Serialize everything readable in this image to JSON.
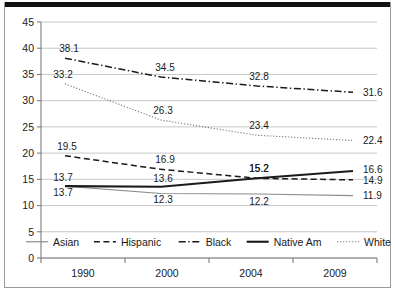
{
  "chart_data": {
    "type": "line",
    "title": "",
    "subtitle": "",
    "xlabel": "",
    "ylabel": "",
    "categories": [
      "1990",
      "2000",
      "2004",
      "2009"
    ],
    "ylim": [
      0,
      45
    ],
    "ytick_step": 5,
    "yticks": [
      "0",
      "5",
      "10",
      "15",
      "20",
      "25",
      "30",
      "35",
      "40",
      "45"
    ],
    "grid": true,
    "legend_position": "inside-bottom",
    "series": [
      {
        "name": "Asian",
        "style": "thin-solid-gray",
        "color": "#8c8c8c",
        "values": [
          13.7,
          12.3,
          12.2,
          11.9
        ],
        "labels": [
          "13.7",
          "12.3",
          "12.2",
          "11.9"
        ]
      },
      {
        "name": "Hispanic",
        "style": "dashed",
        "color": "#1a1a1a",
        "values": [
          19.5,
          16.9,
          15.2,
          14.9
        ],
        "labels": [
          "19.5",
          "16.9",
          "15.2",
          "14.9"
        ]
      },
      {
        "name": "Black",
        "style": "dash-dot",
        "color": "#1a1a1a",
        "values": [
          38.1,
          34.5,
          32.8,
          31.6
        ],
        "labels": [
          "38.1",
          "34.5",
          "32.8",
          "31.6"
        ]
      },
      {
        "name": "Native Am",
        "style": "thick-solid",
        "color": "#1a1a1a",
        "values": [
          13.7,
          13.6,
          15.2,
          16.6
        ],
        "labels": [
          "13.7",
          "13.6",
          "15.2",
          "16.6"
        ]
      },
      {
        "name": "White",
        "style": "dotted",
        "color": "#6f6f6f",
        "values": [
          33.2,
          26.3,
          23.4,
          22.4
        ],
        "labels": [
          "33.2",
          "26.3",
          "23.4",
          "22.4"
        ]
      }
    ]
  },
  "legend": {
    "items": [
      {
        "label": "Asian"
      },
      {
        "label": "Hispanic"
      },
      {
        "label": "Black"
      },
      {
        "label": "Native Am"
      },
      {
        "label": "White"
      }
    ]
  },
  "colors": {
    "background": "#ffffff",
    "grid": "#b9b9b9",
    "axis": "#7d7d7d",
    "ink": "#1a1a1a",
    "gray_series": "#8c8c8c",
    "top_rule": "#111111"
  }
}
